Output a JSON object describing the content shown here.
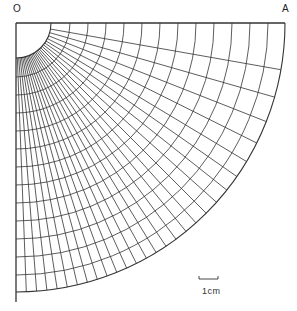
{
  "labels": {
    "origin": "O",
    "end": "A",
    "scale": "1cm"
  },
  "geometry": {
    "origin": [
      16,
      23
    ],
    "inner_radius": 35,
    "outer_radius": 269,
    "arc_radii": [
      35,
      54,
      72,
      90,
      108,
      126,
      144,
      162,
      180,
      198,
      216,
      234,
      252,
      269
    ],
    "radial_angles_deg_from_vertical": [
      0,
      2.2,
      4.4,
      6.6,
      8.8,
      11,
      13.2,
      15.4,
      17.6,
      19.8,
      22,
      24.3,
      26.6,
      29,
      31.4,
      33.9,
      36.5,
      39.2,
      42,
      45,
      48.2,
      51.6,
      55.2,
      59,
      63.5,
      68.5,
      74,
      80,
      90
    ],
    "scale_bar": {
      "x1": 199,
      "x2": 218,
      "y": 279
    }
  },
  "colors": {
    "line": "#333333",
    "background": "#ffffff"
  }
}
